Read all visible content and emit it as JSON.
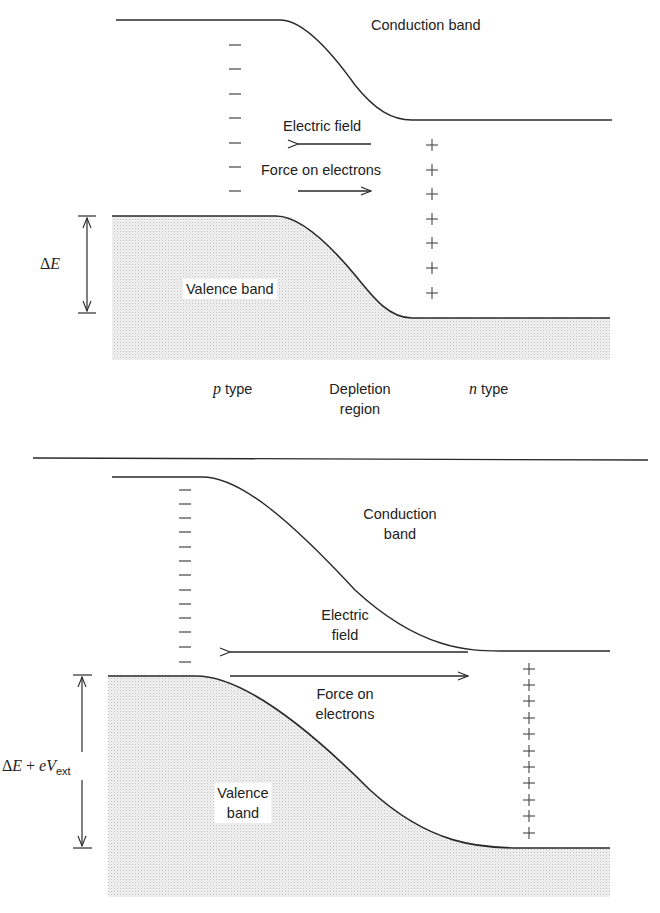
{
  "top_panel": {
    "conduction_band_label": "Conduction band",
    "electric_field_label": "Electric field",
    "force_label": "Force on electrons",
    "valence_band_label": "Valence band",
    "gap_label_delta": "Δ",
    "gap_label_E": "E",
    "region_labels": {
      "p_letter": "p",
      "p_rest": " type",
      "depletion_line1": "Depletion",
      "depletion_line2": "region",
      "n_letter": "n",
      "n_rest": " type"
    },
    "minus_count": 8,
    "plus_count": 7
  },
  "bottom_panel": {
    "conduction_band_line1": "Conduction",
    "conduction_band_line2": "band",
    "electric_field_line1": "Electric",
    "electric_field_line2": "field",
    "force_line1": "Force on",
    "force_line2": "electrons",
    "valence_band_line1": "Valence",
    "valence_band_line2": "band",
    "gap_label_delta": "Δ",
    "gap_label_E": "E",
    "gap_label_plus": "+",
    "gap_label_e": "e",
    "gap_label_V": "V",
    "gap_label_sub": "ext",
    "minus_count": 13,
    "plus_count": 11
  },
  "colors": {
    "line": "#2a2a2a",
    "stipple": "#c8c8c8",
    "background": "#ffffff"
  }
}
